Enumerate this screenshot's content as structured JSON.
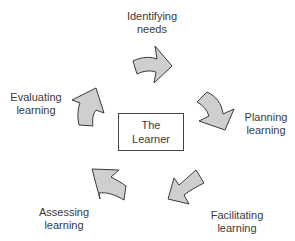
{
  "diagram": {
    "center": {
      "line1": "The",
      "line2": "Learner"
    },
    "stages": [
      {
        "id": "identifying",
        "line1": "Identifying",
        "line2": "needs"
      },
      {
        "id": "planning",
        "line1": "Planning",
        "line2": "learning"
      },
      {
        "id": "facilitating",
        "line1": "Facilitating",
        "line2": "learning"
      },
      {
        "id": "assessing",
        "line1": "Assessing",
        "line2": "learning"
      },
      {
        "id": "evaluating",
        "line1": "Evaluating",
        "line2": "learning"
      }
    ],
    "colors": {
      "arrow_fill": "#cfcfcf",
      "arrow_stroke": "#3a3a3a",
      "text": "#3a3a3a",
      "background": "#ffffff"
    },
    "flow": "clockwise cycle around The Learner"
  }
}
